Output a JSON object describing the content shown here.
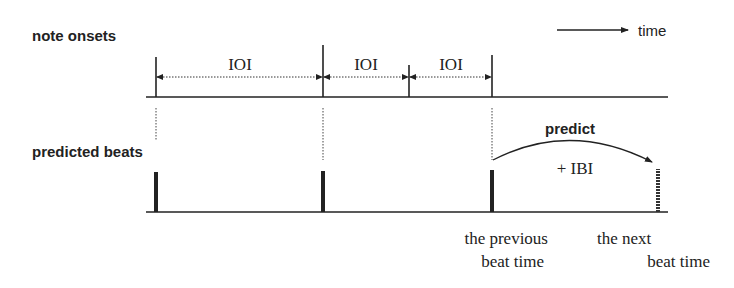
{
  "rows": {
    "onsets": {
      "label": "note onsets"
    },
    "beats": {
      "label": "predicted beats"
    }
  },
  "time_axis": {
    "label": "time"
  },
  "intervals": [
    {
      "label": "IOI"
    },
    {
      "label": "IOI"
    },
    {
      "label": "IOI"
    }
  ],
  "prediction": {
    "arc_label": "predict",
    "increment_label": "+ IBI"
  },
  "annotations": {
    "previous": {
      "line1": "the previous",
      "line2": "beat time"
    },
    "next": {
      "line1": "the next",
      "line2": "beat time"
    }
  },
  "colors": {
    "ink": "#222222",
    "background": "#ffffff"
  }
}
